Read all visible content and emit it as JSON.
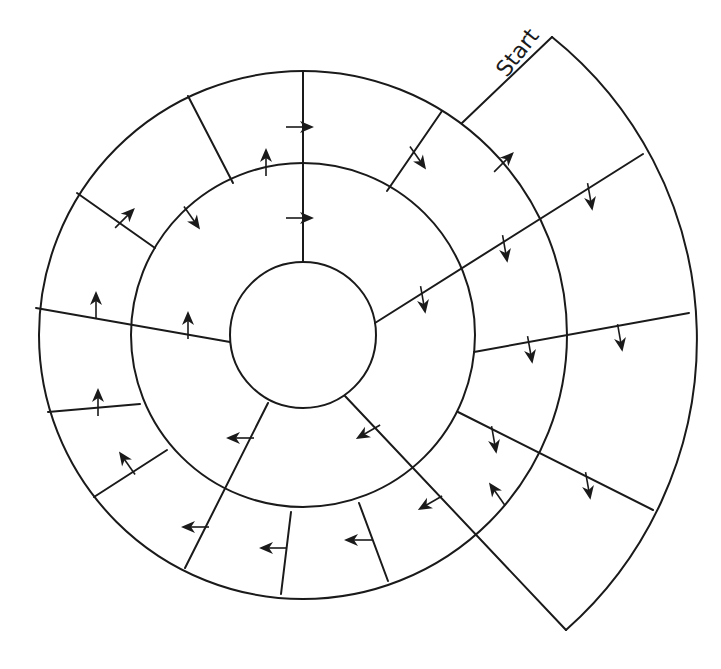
{
  "diagram": {
    "type": "circular-maze",
    "start_label": "Start",
    "colors": {
      "background": "#ffffff",
      "stroke": "#1a1a1a"
    },
    "center": [
      303,
      335
    ],
    "radii": {
      "inner_circle": 73,
      "middle_ring": 172,
      "outer_ring": 264,
      "start_sector": 388
    },
    "start_sector": {
      "start_edge": [
        [
          462,
          123
        ],
        [
          552,
          37
        ]
      ],
      "end_edge": [
        [
          413,
          470
        ],
        [
          566,
          630
        ]
      ]
    },
    "walls": [
      {
        "id": "top-vertical",
        "from": [
          303,
          72
        ],
        "to": [
          303,
          262
        ]
      },
      {
        "id": "top-left",
        "from": [
          188,
          96
        ],
        "to": [
          233,
          183
        ]
      },
      {
        "id": "upper-left",
        "from": [
          77,
          193
        ],
        "to": [
          155,
          248
        ]
      },
      {
        "id": "left",
        "from": [
          36,
          308
        ],
        "to": [
          230,
          342
        ]
      },
      {
        "id": "lower-left-1",
        "from": [
          48,
          412
        ],
        "to": [
          140,
          404
        ]
      },
      {
        "id": "lower-left-2",
        "from": [
          94,
          497
        ],
        "to": [
          167,
          450
        ]
      },
      {
        "id": "lower-long",
        "from": [
          268,
          403
        ],
        "to": [
          185,
          568
        ]
      },
      {
        "id": "bottom-1",
        "from": [
          291,
          512
        ],
        "to": [
          281,
          594
        ]
      },
      {
        "id": "bottom-2",
        "from": [
          359,
          503
        ],
        "to": [
          388,
          581
        ]
      },
      {
        "id": "lower-right-diag",
        "from": [
          345,
          396
        ],
        "to": [
          566,
          630
        ]
      },
      {
        "id": "lower-right",
        "from": [
          458,
          412
        ],
        "to": [
          653,
          510
        ]
      },
      {
        "id": "right",
        "from": [
          474,
          352
        ],
        "to": [
          689,
          313
        ]
      },
      {
        "id": "upper-right-long",
        "from": [
          375,
          323
        ],
        "to": [
          643,
          154
        ]
      },
      {
        "id": "upper-right",
        "from": [
          387,
          191
        ],
        "to": [
          442,
          111
        ]
      }
    ],
    "arrows": [
      {
        "x": 300,
        "y": 127,
        "dir": "right"
      },
      {
        "x": 300,
        "y": 218,
        "dir": "right"
      },
      {
        "x": 266,
        "y": 162,
        "dir": "up"
      },
      {
        "x": 418,
        "y": 158,
        "dir": "down-right"
      },
      {
        "x": 504,
        "y": 162,
        "dir": "up-right"
      },
      {
        "x": 192,
        "y": 218,
        "dir": "down-right"
      },
      {
        "x": 125,
        "y": 218,
        "dir": "up-right"
      },
      {
        "x": 96,
        "y": 305,
        "dir": "up"
      },
      {
        "x": 188,
        "y": 325,
        "dir": "up"
      },
      {
        "x": 98,
        "y": 402,
        "dir": "up"
      },
      {
        "x": 127,
        "y": 463,
        "dir": "up-left"
      },
      {
        "x": 240,
        "y": 438,
        "dir": "left"
      },
      {
        "x": 195,
        "y": 527,
        "dir": "left"
      },
      {
        "x": 273,
        "y": 548,
        "dir": "left"
      },
      {
        "x": 358,
        "y": 540,
        "dir": "left"
      },
      {
        "x": 368,
        "y": 432,
        "dir": "down-left"
      },
      {
        "x": 430,
        "y": 503,
        "dir": "down-left"
      },
      {
        "x": 497,
        "y": 494,
        "dir": "up-left"
      },
      {
        "x": 494,
        "y": 440,
        "dir": "down"
      },
      {
        "x": 588,
        "y": 486,
        "dir": "down"
      },
      {
        "x": 423,
        "y": 300,
        "dir": "down"
      },
      {
        "x": 505,
        "y": 249,
        "dir": "down"
      },
      {
        "x": 590,
        "y": 197,
        "dir": "down"
      },
      {
        "x": 530,
        "y": 350,
        "dir": "down"
      },
      {
        "x": 620,
        "y": 338,
        "dir": "down"
      }
    ]
  }
}
